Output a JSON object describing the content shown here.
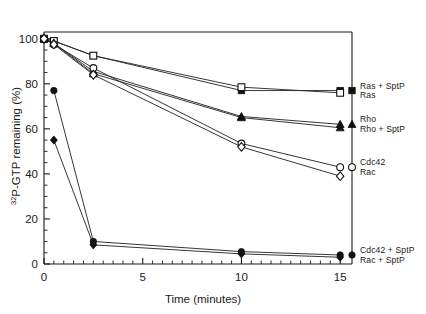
{
  "chart_data": {
    "type": "line",
    "title": "",
    "xlabel": "Time (minutes)",
    "ylabel": "32P-GTP remaining (%)",
    "ylabel_superscript": "32",
    "ylabel_rest": "P-GTP remaining (%)",
    "xlim": [
      0,
      15.6
    ],
    "ylim": [
      0,
      103
    ],
    "x_ticks": [
      0,
      5,
      10,
      15
    ],
    "x_tick_labels": [
      "0",
      "5",
      "10",
      "15"
    ],
    "x_minor_step": 0.5,
    "y_ticks": [
      0,
      20,
      40,
      60,
      80,
      100
    ],
    "y_tick_labels": [
      "0",
      "20",
      "40",
      "60",
      "80",
      "100"
    ],
    "y_minor_step": 5,
    "grid": false,
    "legend_position": "right-outside",
    "series": [
      {
        "name": "Ras + SptP",
        "marker": "filled-square",
        "x": [
          0,
          0.5,
          2.5,
          10,
          15
        ],
        "y": [
          100,
          99,
          92.5,
          77,
          77
        ]
      },
      {
        "name": "Ras",
        "marker": "open-square",
        "x": [
          0,
          0.5,
          2.5,
          10,
          15
        ],
        "y": [
          100,
          99,
          92.5,
          78.5,
          76
        ]
      },
      {
        "name": "Rho",
        "marker": "filled-triangle",
        "x": [
          0,
          0.5,
          2.5,
          10,
          15
        ],
        "y": [
          100,
          98,
          85.5,
          65.5,
          62
        ]
      },
      {
        "name": "Rho + SptP",
        "marker": "filled-triangle",
        "x": [
          0,
          0.5,
          2.5,
          10,
          15
        ],
        "y": [
          100,
          98,
          84.5,
          65,
          60.5
        ]
      },
      {
        "name": "Cdc42",
        "marker": "open-circle",
        "x": [
          0,
          0.5,
          2.5,
          10,
          15
        ],
        "y": [
          100,
          97.5,
          87,
          53.5,
          43
        ]
      },
      {
        "name": "Rac",
        "marker": "open-diamond",
        "x": [
          0,
          0.5,
          2.5,
          10,
          15
        ],
        "y": [
          100,
          97.5,
          84,
          52,
          39
        ]
      },
      {
        "name": "Cdc42 + SptP",
        "marker": "filled-circle",
        "x": [
          0.5,
          2.5,
          10,
          15
        ],
        "y": [
          77,
          10,
          5.5,
          4
        ]
      },
      {
        "name": "Rac + SptP",
        "marker": "filled-diamond",
        "x": [
          0.5,
          2.5,
          10,
          15
        ],
        "y": [
          55,
          8.5,
          4.5,
          3
        ]
      }
    ],
    "legend_groups": [
      {
        "marker": "filled-square",
        "y_anchor": 77,
        "labels": [
          "Ras + SptP",
          "Ras"
        ]
      },
      {
        "marker": "filled-triangle",
        "y_anchor": 62,
        "labels": [
          "Rho",
          "Rho + SptP"
        ]
      },
      {
        "marker": "open-circle",
        "y_anchor": 43,
        "labels": [
          "Cdc42",
          "Rac"
        ]
      },
      {
        "marker": "filled-circle",
        "y_anchor": 4,
        "labels": [
          "Cdc42 + SptP",
          "Rac + SptP"
        ]
      }
    ]
  },
  "colors": {
    "ink": "#1a1a1a",
    "line": "#2b2b2b",
    "background": "#ffffff"
  }
}
